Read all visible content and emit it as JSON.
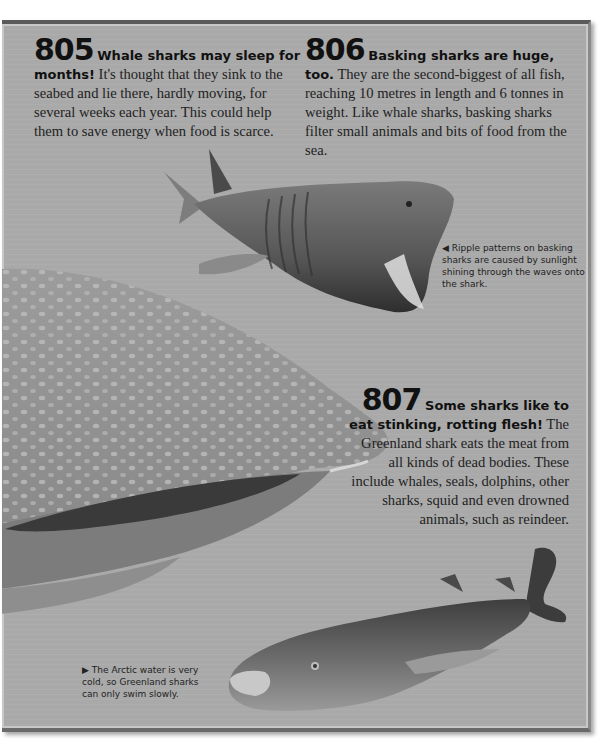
{
  "facts": [
    {
      "number": "805",
      "headline": "Whale sharks may sleep for months!",
      "body": "It's thought that they sink to the seabed and lie there, hardly moving, for several weeks each year. This could help them to save energy when food is scarce."
    },
    {
      "number": "806",
      "headline": "Basking sharks are huge, too.",
      "body": "They are the second-biggest of all fish, reaching 10 metres in length and 6 tonnes in weight. Like whale sharks, basking sharks filter small animals and bits of food from the sea."
    },
    {
      "number": "807",
      "headline": "Some sharks like to eat stinking, rotting flesh!",
      "body": "The Greenland shark eats the meat from all kinds of dead bodies. These include whales, seals, dolphins, other sharks, squid and even drowned animals, such as reindeer."
    }
  ],
  "captions": [
    {
      "arrow": "◀",
      "text": "Ripple patterns on basking sharks are caused by sunlight shining through the waves onto the shark."
    },
    {
      "arrow": "▶",
      "text": "The Arctic water is very cold, so Greenland sharks can only swim slowly."
    }
  ],
  "images": {
    "basking_shark": "basking-shark-illustration",
    "whale_shark": "whale-shark-head-illustration",
    "greenland_shark": "greenland-shark-illustration"
  },
  "colors": {
    "page_bg": "#a9a9a9",
    "border": "#5a5a5a",
    "text": "#222222"
  }
}
